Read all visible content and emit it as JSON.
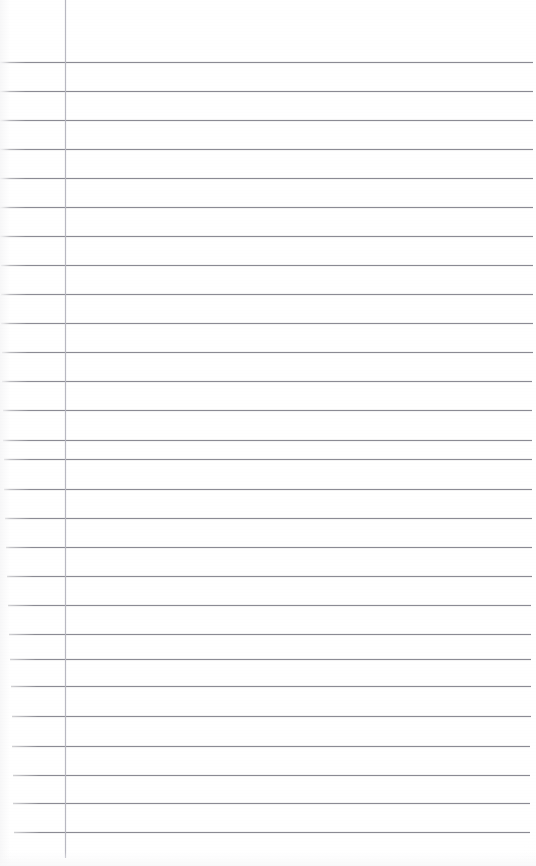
{
  "document": {
    "kind": "scanned-ruled-notebook-page",
    "title": "",
    "body_text": "",
    "is_blank": true,
    "page_width": 536,
    "page_height": 866,
    "background_color": "#ffffff"
  },
  "ruling": {
    "horizontal_rule_color": "#7e7e86",
    "vertical_rule_color": "#b9b9c2",
    "rule_thickness_px": 1,
    "line_spacing_px": 29.6,
    "first_line_y": 62,
    "last_line_y": 832,
    "line_count": 27,
    "margin_rule_x": 65,
    "margin_rule_top_y": 0,
    "margin_rule_bottom_y": 858,
    "lines": [
      {
        "index": 1,
        "y": 62,
        "x_start": 0,
        "x_end": 533
      },
      {
        "index": 2,
        "y": 91,
        "x_start": 0,
        "x_end": 533
      },
      {
        "index": 3,
        "y": 120,
        "x_start": 0,
        "x_end": 533
      },
      {
        "index": 4,
        "y": 149,
        "x_start": 0,
        "x_end": 533
      },
      {
        "index": 5,
        "y": 178,
        "x_start": 0,
        "x_end": 533
      },
      {
        "index": 6,
        "y": 207,
        "x_start": 0,
        "x_end": 533
      },
      {
        "index": 7,
        "y": 236,
        "x_start": 0,
        "x_end": 533
      },
      {
        "index": 8,
        "y": 265,
        "x_start": 1,
        "x_end": 533
      },
      {
        "index": 9,
        "y": 294,
        "x_start": 1,
        "x_end": 533
      },
      {
        "index": 10,
        "y": 323,
        "x_start": 1,
        "x_end": 533
      },
      {
        "index": 11,
        "y": 352,
        "x_start": 2,
        "x_end": 533
      },
      {
        "index": 12,
        "y": 381,
        "x_start": 2,
        "x_end": 532
      },
      {
        "index": 13,
        "y": 410,
        "x_start": 3,
        "x_end": 532
      },
      {
        "index": 14,
        "y": 440,
        "x_start": 3,
        "x_end": 532
      },
      {
        "index": 15,
        "y": 459,
        "x_start": 4,
        "x_end": 532
      },
      {
        "index": 16,
        "y": 489,
        "x_start": 4,
        "x_end": 532
      },
      {
        "index": 17,
        "y": 518,
        "x_start": 5,
        "x_end": 532
      },
      {
        "index": 18,
        "y": 547,
        "x_start": 6,
        "x_end": 532
      },
      {
        "index": 19,
        "y": 576,
        "x_start": 7,
        "x_end": 532
      },
      {
        "index": 20,
        "y": 605,
        "x_start": 8,
        "x_end": 531
      },
      {
        "index": 21,
        "y": 634,
        "x_start": 9,
        "x_end": 531
      },
      {
        "index": 22,
        "y": 659,
        "x_start": 10,
        "x_end": 531
      },
      {
        "index": 23,
        "y": 686,
        "x_start": 11,
        "x_end": 531
      },
      {
        "index": 24,
        "y": 716,
        "x_start": 12,
        "x_end": 531
      },
      {
        "index": 25,
        "y": 746,
        "x_start": 12,
        "x_end": 530
      },
      {
        "index": 26,
        "y": 775,
        "x_start": 13,
        "x_end": 530
      },
      {
        "index": 27,
        "y": 803,
        "x_start": 13,
        "x_end": 530
      },
      {
        "index": 28,
        "y": 832,
        "x_start": 14,
        "x_end": 530
      }
    ]
  }
}
